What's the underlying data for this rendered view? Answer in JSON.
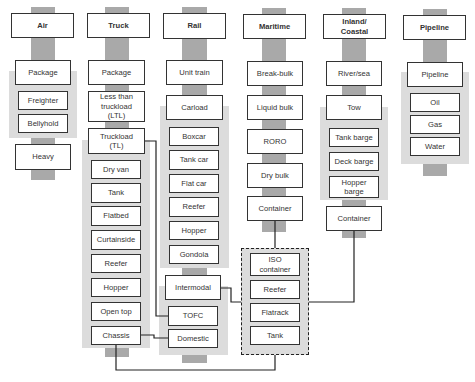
{
  "diagram": {
    "modes": [
      {
        "name": "Air",
        "services": [
          "Package",
          "Heavy"
        ],
        "equipment_groups": [
          {
            "parent": "Package",
            "items": [
              "Freighter",
              "Bellyhold"
            ]
          }
        ]
      },
      {
        "name": "Truck",
        "services": [
          "Package",
          "Less than truckload (LTL)",
          "Truckload (TL)"
        ],
        "equipment_groups": [
          {
            "parent": "Truckload (TL)",
            "items": [
              "Dry van",
              "Tank",
              "Flatbed",
              "Curtainside",
              "Reefer",
              "Hopper",
              "Open top",
              "Chassis"
            ]
          }
        ]
      },
      {
        "name": "Rail",
        "services": [
          "Unit train",
          "Carload",
          "Intermodal"
        ],
        "equipment_groups": [
          {
            "parent": "Carload",
            "items": [
              "Boxcar",
              "Tank car",
              "Flat car",
              "Reefer",
              "Hopper",
              "Gondola"
            ]
          },
          {
            "parent": "Intermodal",
            "items": [
              "TOFC",
              "Domestic"
            ]
          }
        ]
      },
      {
        "name": "Maritime",
        "services": [
          "Break-bulk",
          "Liquid bulk",
          "RORO",
          "Dry bulk",
          "Container"
        ],
        "equipment_groups": []
      },
      {
        "name": "Inland/ Coastal",
        "services": [
          "River/sea",
          "Tow",
          "Container"
        ],
        "equipment_groups": [
          {
            "parent": "Tow",
            "items": [
              "Tank barge",
              "Deck barge",
              "Hopper barge"
            ]
          }
        ]
      },
      {
        "name": "Pipeline",
        "services": [
          "Pipeline"
        ],
        "equipment_groups": [
          {
            "parent": "Pipeline",
            "items": [
              "Oil",
              "Gas",
              "Water"
            ]
          }
        ]
      }
    ],
    "shared_container_group": {
      "style": "dashed",
      "items": [
        "ISO container",
        "Reefer",
        "Flatrack",
        "Tank"
      ]
    },
    "connections": [
      {
        "from": "Truck: Truckload (TL)",
        "to": "Rail: TOFC"
      },
      {
        "from": "Truck: Chassis",
        "to": "Rail: Domestic"
      },
      {
        "from": "Truck: Chassis",
        "to": "ISO container group"
      },
      {
        "from": "Rail: Intermodal",
        "to": "ISO container group"
      },
      {
        "from": "Maritime: Container",
        "to": "ISO container group"
      },
      {
        "from": "Inland/Coastal: Container",
        "to": "ISO container group"
      }
    ],
    "colors": {
      "spine": "#a9a9a9",
      "panel": "#dcdcdc",
      "box_border": "#333333",
      "box_fill": "#ffffff"
    }
  },
  "labels": {
    "air": {
      "header": "Air",
      "package": "Package",
      "freighter": "Freighter",
      "bellyhold": "Bellyhold",
      "heavy": "Heavy"
    },
    "truck": {
      "header": "Truck",
      "package": "Package",
      "ltl": "Less than truckload (LTL)",
      "tl": "Truckload (TL)",
      "dry_van": "Dry van",
      "tank": "Tank",
      "flatbed": "Flatbed",
      "curtainside": "Curtainside",
      "reefer": "Reefer",
      "hopper": "Hopper",
      "open_top": "Open top",
      "chassis": "Chassis"
    },
    "rail": {
      "header": "Rail",
      "unit_train": "Unit train",
      "carload": "Carload",
      "boxcar": "Boxcar",
      "tank_car": "Tank car",
      "flat_car": "Flat car",
      "reefer": "Reefer",
      "hopper": "Hopper",
      "gondola": "Gondola",
      "intermodal": "Intermodal",
      "tofc": "TOFC",
      "domestic": "Domestic"
    },
    "maritime": {
      "header": "Maritime",
      "break_bulk": "Break-bulk",
      "liquid_bulk": "Liquid bulk",
      "roro": "RORO",
      "dry_bulk": "Dry bulk",
      "container": "Container"
    },
    "container_group": {
      "iso": "ISO container",
      "reefer": "Reefer",
      "flatrack": "Flatrack",
      "tank": "Tank"
    },
    "inland": {
      "header": "Inland/ Coastal",
      "river_sea": "River/sea",
      "tow": "Tow",
      "tank_barge": "Tank barge",
      "deck_barge": "Deck barge",
      "hopper_barge": "Hopper barge",
      "container": "Container"
    },
    "pipeline": {
      "header": "Pipeline",
      "pipeline": "Pipeline",
      "oil": "Oil",
      "gas": "Gas",
      "water": "Water"
    }
  }
}
